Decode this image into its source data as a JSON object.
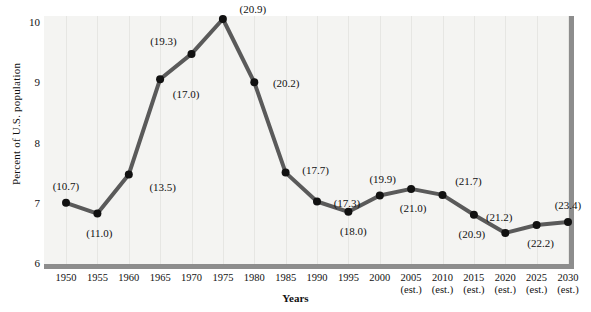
{
  "chart_data": {
    "type": "line",
    "title": "",
    "xlabel": "Years",
    "ylabel": "Percent of U.S. population",
    "ylim": [
      6,
      10.2
    ],
    "yticks": [
      6,
      7,
      8,
      9,
      10
    ],
    "grid": "vertical-faint",
    "legend": "none",
    "categories": [
      "1950",
      "1955",
      "1960",
      "1965",
      "1970",
      "1975",
      "1980",
      "1985",
      "1990",
      "1995",
      "2000",
      "2005",
      "2010",
      "2015",
      "2020",
      "2025",
      "2030"
    ],
    "tick_notes": [
      "",
      "",
      "",
      "",
      "",
      "",
      "",
      "",
      "",
      "",
      "",
      "(est.)",
      "(est.)",
      "(est.)",
      "(est.)",
      "(est.)",
      "(est.)"
    ],
    "values": [
      7.0,
      6.82,
      7.47,
      9.05,
      9.47,
      10.05,
      9.0,
      7.5,
      7.02,
      6.85,
      7.12,
      7.23,
      7.13,
      6.8,
      6.5,
      6.63,
      6.68
    ],
    "point_labels": [
      "(10.7)",
      "(11.0)",
      "(13.5)",
      "(17.0)",
      "(19.3)",
      "(20.9)",
      "(20.2)",
      "(17.7)",
      "(17.3)",
      "(18.0)",
      "(19.9)",
      "(21.0)",
      "(21.7)",
      "(20.9)",
      "(21.2)",
      "(22.2)",
      "(23.4)"
    ],
    "label_offsets": [
      {
        "dx": 0,
        "dy": -17
      },
      {
        "dx": 2,
        "dy": 19
      },
      {
        "dx": 34,
        "dy": 13
      },
      {
        "dx": 26,
        "dy": 15
      },
      {
        "dx": -28,
        "dy": -13
      },
      {
        "dx": 30,
        "dy": -10
      },
      {
        "dx": 32,
        "dy": 1
      },
      {
        "dx": 30,
        "dy": -3
      },
      {
        "dx": 30,
        "dy": 1
      },
      {
        "dx": 5,
        "dy": 19
      },
      {
        "dx": 3,
        "dy": -17
      },
      {
        "dx": 2,
        "dy": 19
      },
      {
        "dx": 26,
        "dy": -14
      },
      {
        "dx": -2,
        "dy": 19
      },
      {
        "dx": -6,
        "dy": -16
      },
      {
        "dx": 4,
        "dy": 18
      },
      {
        "dx": 0,
        "dy": -17
      }
    ],
    "colors": {
      "line": "#5a5a5a",
      "marker": "#111111",
      "plot_background": "#f4f4f2",
      "axis": "#8d8d8d",
      "grid": "#e6e6e3",
      "text": "#111111"
    }
  }
}
